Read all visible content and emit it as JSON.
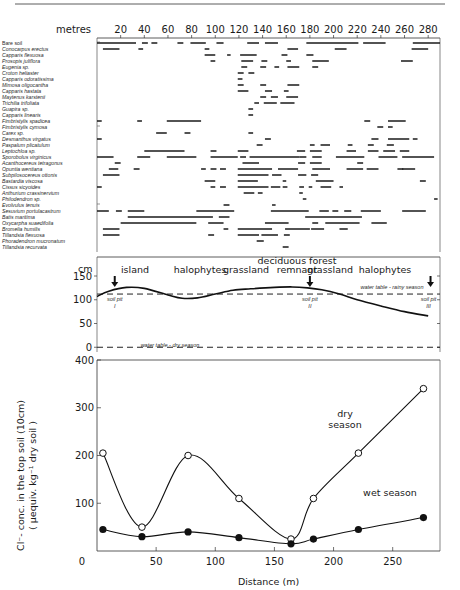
{
  "chart_data": [
    {
      "type": "bar",
      "subtype": "occurrence-range chart",
      "title": "",
      "xlabel": "metres",
      "xticks": [
        20,
        40,
        60,
        80,
        100,
        120,
        140,
        160,
        180,
        200,
        220,
        240,
        260,
        280
      ],
      "xlim": [
        0,
        290
      ],
      "species": [
        {
          "name": "Bare soil",
          "segments": [
            [
              0,
              33
            ],
            [
              38,
              43
            ],
            [
              46,
              51
            ],
            [
              68,
              73
            ],
            [
              79,
              92
            ],
            [
              101,
              107
            ],
            [
              127,
              137
            ],
            [
              142,
              153
            ],
            [
              177,
              221
            ],
            [
              225,
              244
            ],
            [
              267,
              290
            ]
          ]
        },
        {
          "name": "Conocarpus  erectus",
          "segments": [
            [
              5,
              19
            ],
            [
              35,
              39
            ],
            [
              91,
              95
            ],
            [
              161,
              170
            ],
            [
              201,
              211
            ],
            [
              266,
              280
            ]
          ]
        },
        {
          "name": "Capparis flexuosa",
          "segments": [
            [
              91,
              100
            ],
            [
              110,
              113
            ],
            [
              121,
              135
            ],
            [
              156,
              161
            ],
            [
              177,
              183
            ]
          ]
        },
        {
          "name": "Prosopis juliflora",
          "segments": [
            [
              96,
              100
            ],
            [
              122,
              132
            ],
            [
              139,
              144
            ],
            [
              160,
              164
            ],
            [
              182,
              196
            ],
            [
              257,
              267
            ]
          ]
        },
        {
          "name": "Eugenia sp.",
          "segments": [
            [
              122,
              127
            ],
            [
              138,
              143
            ],
            [
              150,
              154
            ],
            [
              161,
              171
            ],
            [
              182,
              187
            ]
          ]
        },
        {
          "name": "Croton heliaster",
          "segments": [
            [
              119,
              124
            ],
            [
              128,
              133
            ]
          ]
        },
        {
          "name": "Capparis odoratissima",
          "segments": [
            [
              119,
              123
            ]
          ]
        },
        {
          "name": "Mimosa oligocantha",
          "segments": [
            [
              119,
              124
            ],
            [
              138,
              143
            ],
            [
              161,
              171
            ]
          ]
        },
        {
          "name": "Capparis hastata",
          "segments": [
            [
              119,
              128
            ],
            [
              142,
              148
            ],
            [
              158,
              162
            ]
          ]
        },
        {
          "name": "Maytenus karstenii",
          "segments": [
            [
              138,
              143
            ],
            [
              147,
              153
            ],
            [
              160,
              170
            ]
          ]
        },
        {
          "name": "Trichilia trifoliata",
          "segments": [
            [
              133,
              137
            ],
            [
              141,
              152
            ],
            [
              155,
              167
            ]
          ]
        },
        {
          "name": "Guapira sp.",
          "segments": [
            [
              128,
              132
            ]
          ]
        },
        {
          "name": "Capparis linearis",
          "segments": [
            [
              128,
              132
            ]
          ]
        },
        {
          "name": "Fimbristylis spadicea",
          "segments": [
            [
              0,
              4
            ],
            [
              34,
              38
            ],
            [
              59,
              88
            ],
            [
              226,
              231
            ],
            [
              246,
              261
            ]
          ]
        },
        {
          "name": "Fimbristylis cymosa",
          "segments": [
            [
              237,
              242
            ],
            [
              246,
              250
            ]
          ]
        },
        {
          "name": "Carex sp.",
          "segments": [
            [
              50,
              59
            ],
            [
              74,
              79
            ],
            [
              128,
              132
            ]
          ]
        },
        {
          "name": "Desmanthus virgatus",
          "segments": [
            [
              0,
              4
            ],
            [
              142,
              147
            ],
            [
              232,
              238
            ],
            [
              246,
              264
            ],
            [
              267,
              271
            ]
          ]
        },
        {
          "name": "Paspalum plicatulum",
          "segments": [
            [
              135,
              140
            ],
            [
              180,
              184
            ],
            [
              189,
              197
            ],
            [
              212,
              216
            ],
            [
              229,
              234
            ],
            [
              245,
              251
            ]
          ]
        },
        {
          "name": "Leptochloa sp.",
          "segments": [
            [
              40,
              74
            ],
            [
              96,
              101
            ],
            [
              119,
              128
            ],
            [
              169,
              176
            ],
            [
              180,
              190
            ],
            [
              211,
              219
            ],
            [
              229,
              238
            ],
            [
              242,
              252
            ],
            [
              256,
              264
            ]
          ]
        },
        {
          "name": "Sporobolus virginicus",
          "segments": [
            [
              0,
              14
            ],
            [
              34,
              45
            ],
            [
              59,
              84
            ],
            [
              96,
              119
            ],
            [
              121,
              126
            ],
            [
              129,
              171
            ],
            [
              171,
              177
            ],
            [
              182,
              190
            ],
            [
              202,
              226
            ],
            [
              238,
              254
            ],
            [
              258,
              285
            ]
          ]
        },
        {
          "name": "Acanthocereus tetragonus",
          "segments": [
            [
              15,
              20
            ],
            [
              123,
              137
            ],
            [
              170,
              176
            ],
            [
              180,
              190
            ],
            [
              220,
              225
            ]
          ]
        },
        {
          "name": "Opuntia wentiana",
          "segments": [
            [
              10,
              18
            ],
            [
              31,
              36
            ],
            [
              88,
              92
            ],
            [
              96,
              101
            ],
            [
              104,
              109
            ],
            [
              119,
              148
            ],
            [
              153,
              170
            ],
            [
              182,
              197
            ],
            [
              211,
              225
            ],
            [
              228,
              238
            ],
            [
              254,
              259
            ],
            [
              258,
              269
            ]
          ]
        },
        {
          "name": "Subpilosocereus ottonis",
          "segments": [
            [
              5,
              19
            ],
            [
              119,
              145
            ],
            [
              148,
              156
            ],
            [
              170,
              177
            ],
            [
              181,
              187
            ]
          ]
        },
        {
          "name": "Bastardia viscosa",
          "segments": [
            [
              91,
              100
            ],
            [
              119,
              136
            ],
            [
              157,
              160
            ],
            [
              185,
              200
            ],
            [
              273,
              278
            ]
          ]
        },
        {
          "name": "Cissus sicyoides",
          "segments": [
            [
              0,
              4
            ],
            [
              96,
              100
            ],
            [
              104,
              109
            ],
            [
              119,
              145
            ],
            [
              147,
              155
            ],
            [
              157,
              161
            ],
            [
              171,
              175
            ],
            [
              179,
              182
            ],
            [
              189,
              198
            ],
            [
              205,
              208
            ]
          ]
        },
        {
          "name": "Anthurium crassinervium",
          "segments": [
            [
              124,
              133
            ],
            [
              136,
              140
            ],
            [
              171,
              174
            ]
          ]
        },
        {
          "name": "Philodendron sp.",
          "segments": [
            [
              174,
              177
            ],
            [
              285,
              288
            ]
          ]
        },
        {
          "name": "Evolvulus tenuis",
          "segments": [
            [
              107,
              112
            ],
            [
              148,
              151
            ]
          ]
        },
        {
          "name": "Sesuvium portulacastrum",
          "segments": [
            [
              0,
              10
            ],
            [
              16,
              21
            ],
            [
              26,
              40
            ],
            [
              84,
              116
            ],
            [
              147,
              179
            ],
            [
              188,
              196
            ],
            [
              199,
              204
            ],
            [
              209,
              215
            ],
            [
              223,
              240
            ],
            [
              258,
              278
            ]
          ]
        },
        {
          "name": "Batis maritima",
          "segments": [
            [
              26,
              98
            ],
            [
              103,
              112
            ],
            [
              176,
              224
            ]
          ]
        },
        {
          "name": "Oxycarpha suaedifolia",
          "segments": [
            [
              20,
              84
            ],
            [
              94,
              107
            ],
            [
              142,
              162
            ],
            [
              182,
              187
            ],
            [
              193,
              222
            ],
            [
              232,
              245
            ]
          ]
        },
        {
          "name": "Bromelia humilis",
          "segments": [
            [
              5,
              19
            ],
            [
              107,
              111
            ],
            [
              119,
              148
            ],
            [
              159,
              180
            ],
            [
              181,
              192
            ],
            [
              205,
              212
            ]
          ]
        },
        {
          "name": "Tillandsia flexuosa",
          "segments": [
            [
              5,
              19
            ],
            [
              94,
              99
            ],
            [
              119,
              137
            ],
            [
              139,
              153
            ],
            [
              158,
              163
            ]
          ]
        },
        {
          "name": "Phoradendron mucronatum",
          "segments": [
            [
              135,
              141
            ]
          ]
        },
        {
          "name": "Tillandsia recurvata",
          "segments": [
            [
              157,
              162
            ]
          ]
        }
      ]
    },
    {
      "type": "line",
      "subtype": "topographic profile",
      "ylabel": "cm",
      "yticks": [
        0,
        50,
        100,
        150
      ],
      "ylim": [
        -10,
        190
      ],
      "xlim": [
        0,
        290
      ],
      "zones": [
        "island",
        "halophytes",
        "grassland",
        "deciduous forest remnant",
        "grassland",
        "halophytes"
      ],
      "surface": {
        "x": [
          0,
          10,
          25,
          40,
          60,
          72,
          85,
          100,
          115,
          130,
          150,
          165,
          178,
          190,
          205,
          220,
          240,
          260,
          280
        ],
        "y": [
          107,
          118,
          126,
          124,
          110,
          103,
          104,
          112,
          120,
          123,
          126,
          127,
          125,
          121,
          112,
          100,
          87,
          75,
          66
        ]
      },
      "water_table_rainy": 112,
      "water_table_dry": 0,
      "annotations": [
        {
          "text": "water table - rainy season"
        },
        {
          "text": "water table - dry season"
        },
        {
          "text": "soil pit",
          "numeral": "I",
          "x": 15
        },
        {
          "text": "soil pit",
          "numeral": "II",
          "x": 180
        },
        {
          "text": "soil pit",
          "numeral": "III",
          "x": 282
        }
      ]
    },
    {
      "type": "line",
      "title": "",
      "xlabel": "Distance  (m)",
      "ylabel_line1": "Cl⁻- conc. in the top soil (10cm)",
      "ylabel_line2": "( µequiv. kg⁻¹  dry soil )",
      "xticks": [
        0,
        50,
        100,
        150,
        200,
        250
      ],
      "yticks": [
        0,
        100,
        200,
        300,
        400
      ],
      "xlim": [
        0,
        290
      ],
      "ylim": [
        0,
        400
      ],
      "series": [
        {
          "name": "dry season",
          "label_line1": "dry",
          "label_line2": "season",
          "marker": "open-circle",
          "x": [
            5,
            38,
            77,
            120,
            164,
            183,
            221,
            276
          ],
          "y": [
            205,
            50,
            200,
            110,
            25,
            110,
            205,
            340
          ]
        },
        {
          "name": "wet season",
          "label_line1": "wet season",
          "marker": "filled-circle",
          "x": [
            5,
            38,
            77,
            120,
            164,
            183,
            221,
            276
          ],
          "y": [
            45,
            30,
            40,
            28,
            15,
            25,
            45,
            70
          ]
        }
      ]
    }
  ]
}
